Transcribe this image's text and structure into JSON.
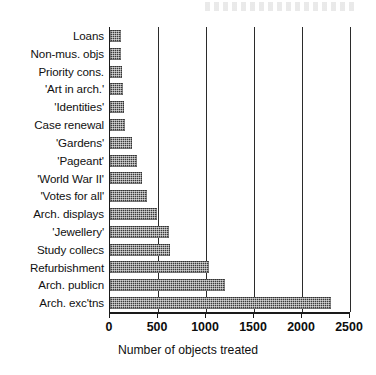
{
  "chart_data": {
    "type": "bar",
    "orientation": "horizontal",
    "title": "",
    "xlabel": "Number of objects treated",
    "ylabel": "",
    "xlim": [
      0,
      2500
    ],
    "xticks": [
      0,
      500,
      1000,
      1500,
      2000,
      2500
    ],
    "xtick_labels": [
      "0",
      "500",
      "1000",
      "1500",
      "2000",
      "2500"
    ],
    "grid": true,
    "grid_axis": "x",
    "legend": null,
    "bar_color": "#3a3a3a",
    "bar_fill": "dithered-halftone",
    "categories": [
      "Loans",
      "Non-mus. objs",
      "Priority cons.",
      "'Art in arch.'",
      "'Identities'",
      "Case renewal",
      "'Gardens'",
      "'Pageant'",
      "'World War II'",
      "'Votes for all'",
      "Arch. displays",
      "'Jewellery'",
      "Study collecs",
      "Refurbishment",
      "Arch. publicn",
      "Arch. exc'tns"
    ],
    "values": [
      110,
      110,
      130,
      140,
      150,
      155,
      230,
      280,
      330,
      390,
      490,
      610,
      620,
      1030,
      1200,
      2300
    ]
  }
}
